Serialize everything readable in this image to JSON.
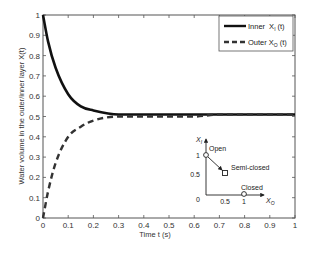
{
  "chart_data": {
    "type": "line",
    "title": "",
    "xlabel": "Time t (s)",
    "ylabel": "Water volume in the outer/inner layer X(t)",
    "xlim": [
      0,
      1
    ],
    "ylim": [
      0,
      1
    ],
    "grid": false,
    "legend_position": "upper right",
    "x_ticks": [
      "0",
      "0.1",
      "0.2",
      "0.3",
      "0.4",
      "0.5",
      "0.6",
      "0.7",
      "0.8",
      "0.9",
      "1"
    ],
    "y_ticks": [
      "0",
      "0.1",
      "0.2",
      "0.3",
      "0.4",
      "0.5",
      "0.6",
      "0.7",
      "0.8",
      "0.9",
      "1"
    ],
    "x": [
      0,
      0.02,
      0.05,
      0.1,
      0.15,
      0.2,
      0.3,
      0.4,
      0.5,
      0.6,
      0.7,
      0.8,
      0.9,
      1.0
    ],
    "series": [
      {
        "name": "Inner X_I (t)",
        "style": "solid",
        "values": [
          1.0,
          0.87,
          0.74,
          0.61,
          0.55,
          0.53,
          0.51,
          0.51,
          0.51,
          0.51,
          0.51,
          0.51,
          0.51,
          0.51
        ]
      },
      {
        "name": "Outer X_O (t)",
        "style": "dashed",
        "values": [
          0.0,
          0.13,
          0.27,
          0.4,
          0.45,
          0.48,
          0.5,
          0.5,
          0.5,
          0.5,
          0.51,
          0.51,
          0.51,
          0.51
        ]
      }
    ],
    "annotations": {
      "inset": {
        "x_axis_label": "X_O",
        "y_axis_label": "X_I",
        "x_ticks": [
          "0",
          "0.5",
          "1"
        ],
        "y_ticks": [
          "0.5",
          "1"
        ],
        "points": [
          {
            "label": "Open",
            "x": 0,
            "y": 1,
            "marker": "circle"
          },
          {
            "label": "Semi-closed",
            "x": 0.5,
            "y": 0.5,
            "marker": "square"
          },
          {
            "label": "Closed",
            "x": 1,
            "y": 0,
            "marker": "circle"
          }
        ],
        "arrows": [
          "Open -> Semi-closed",
          "Closed -> Semi-closed direction along X_O axis"
        ]
      }
    }
  },
  "legend": {
    "inner_label": "Inner",
    "inner_var": "X",
    "inner_sub": "I",
    "inner_arg": "(t)",
    "outer_label": "Outer",
    "outer_var": "X",
    "outer_sub": "O",
    "outer_arg": "(t)"
  },
  "inset": {
    "y_var": "X",
    "y_sub": "I",
    "x_var": "X",
    "x_sub": "O",
    "open": "Open",
    "semi_closed": "Semi-closed",
    "closed": "Closed",
    "tick_y1": "1",
    "tick_y05": "0.5",
    "tick_origin": "0",
    "tick_x05": "0.5",
    "tick_x1": "1"
  }
}
